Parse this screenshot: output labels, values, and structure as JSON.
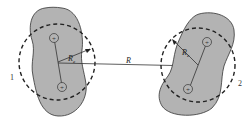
{
  "diagram": {
    "molecule_1": {
      "label": "1",
      "radius_label": "R",
      "radius_subscript": "e",
      "charges": [
        "+",
        "+"
      ]
    },
    "molecule_2": {
      "label": "2",
      "radius_label": "R",
      "radius_subscript": "e",
      "charges": [
        "+",
        "+"
      ]
    },
    "separation_label": "R",
    "colors": {
      "fill": "#b3b3b3",
      "stroke": "#333333",
      "background": "#ffffff"
    }
  }
}
